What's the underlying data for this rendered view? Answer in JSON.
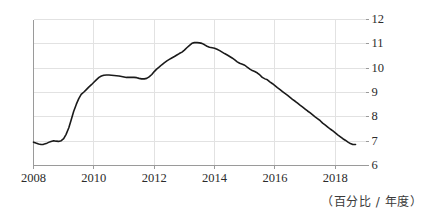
{
  "chart_data": {
    "type": "line",
    "title": "",
    "subtitle": "",
    "xlabel": "",
    "ylabel": "",
    "unit_caption": "（百分比 / 年度）",
    "grid": true,
    "legend": false,
    "legend_position": "none",
    "xlim": [
      2008.0,
      2019.0
    ],
    "ylim": [
      6,
      12
    ],
    "y_ticks": [
      12,
      11,
      10,
      9,
      8,
      7,
      6
    ],
    "y_tick_labels": [
      "12",
      "11",
      "10",
      "9",
      "8",
      "7",
      "6"
    ],
    "y_axis_side": "right",
    "x_ticks": [
      2008,
      2010,
      2012,
      2014,
      2016,
      2018
    ],
    "x_tick_labels": [
      "2008",
      "2010",
      "2012",
      "2014",
      "2016",
      "2018"
    ],
    "line_color": "#1a1a1a",
    "grid_color": "#e2e2e2",
    "axis_color": "#9a9a9a",
    "series": [
      {
        "name": "",
        "color": "#1a1a1a",
        "x": [
          2008.0,
          2008.08,
          2008.17,
          2008.25,
          2008.33,
          2008.42,
          2008.5,
          2008.58,
          2008.67,
          2008.75,
          2008.83,
          2008.92,
          2009.0,
          2009.08,
          2009.17,
          2009.25,
          2009.33,
          2009.42,
          2009.5,
          2009.58,
          2009.67,
          2009.75,
          2009.83,
          2009.92,
          2010.0,
          2010.08,
          2010.17,
          2010.25,
          2010.33,
          2010.42,
          2010.5,
          2010.58,
          2010.67,
          2010.75,
          2010.83,
          2010.92,
          2011.0,
          2011.08,
          2011.17,
          2011.25,
          2011.33,
          2011.42,
          2011.5,
          2011.58,
          2011.67,
          2011.75,
          2011.83,
          2011.92,
          2012.0,
          2012.08,
          2012.17,
          2012.25,
          2012.33,
          2012.42,
          2012.5,
          2012.58,
          2012.67,
          2012.75,
          2012.83,
          2012.92,
          2013.0,
          2013.08,
          2013.17,
          2013.25,
          2013.33,
          2013.42,
          2013.5,
          2013.58,
          2013.67,
          2013.75,
          2013.83,
          2013.92,
          2014.0,
          2014.08,
          2014.17,
          2014.25,
          2014.33,
          2014.42,
          2014.5,
          2014.58,
          2014.67,
          2014.75,
          2014.83,
          2014.92,
          2015.0,
          2015.08,
          2015.17,
          2015.25,
          2015.33,
          2015.42,
          2015.5,
          2015.58,
          2015.67,
          2015.75,
          2015.83,
          2015.92,
          2016.0,
          2016.08,
          2016.17,
          2016.25,
          2016.33,
          2016.42,
          2016.5,
          2016.58,
          2016.67,
          2016.75,
          2016.83,
          2016.92,
          2017.0,
          2017.08,
          2017.17,
          2017.25,
          2017.33,
          2017.42,
          2017.5,
          2017.58,
          2017.67,
          2017.75,
          2017.83,
          2017.92,
          2018.0,
          2018.08,
          2018.17,
          2018.25,
          2018.33,
          2018.42,
          2018.5,
          2018.58,
          2018.67
        ],
        "y": [
          6.96,
          6.92,
          6.88,
          6.86,
          6.87,
          6.9,
          6.95,
          6.99,
          7.02,
          7.0,
          6.99,
          7.02,
          7.1,
          7.28,
          7.55,
          7.88,
          8.22,
          8.52,
          8.75,
          8.92,
          9.02,
          9.12,
          9.22,
          9.32,
          9.42,
          9.52,
          9.62,
          9.68,
          9.71,
          9.72,
          9.72,
          9.71,
          9.7,
          9.69,
          9.68,
          9.66,
          9.64,
          9.62,
          9.62,
          9.62,
          9.62,
          9.61,
          9.58,
          9.56,
          9.56,
          9.58,
          9.64,
          9.74,
          9.86,
          9.96,
          10.05,
          10.14,
          10.22,
          10.3,
          10.36,
          10.42,
          10.48,
          10.54,
          10.6,
          10.66,
          10.74,
          10.84,
          10.94,
          11.02,
          11.05,
          11.05,
          11.04,
          11.02,
          10.96,
          10.9,
          10.86,
          10.84,
          10.82,
          10.78,
          10.72,
          10.66,
          10.6,
          10.54,
          10.48,
          10.42,
          10.34,
          10.26,
          10.2,
          10.16,
          10.12,
          10.04,
          9.96,
          9.9,
          9.86,
          9.8,
          9.72,
          9.62,
          9.56,
          9.52,
          9.44,
          9.36,
          9.28,
          9.2,
          9.12,
          9.04,
          8.96,
          8.88,
          8.8,
          8.72,
          8.64,
          8.56,
          8.48,
          8.4,
          8.32,
          8.24,
          8.16,
          8.08,
          8.0,
          7.92,
          7.84,
          7.74,
          7.66,
          7.58,
          7.5,
          7.42,
          7.34,
          7.26,
          7.18,
          7.1,
          7.04,
          6.96,
          6.9,
          6.86,
          6.86
        ]
      }
    ]
  }
}
